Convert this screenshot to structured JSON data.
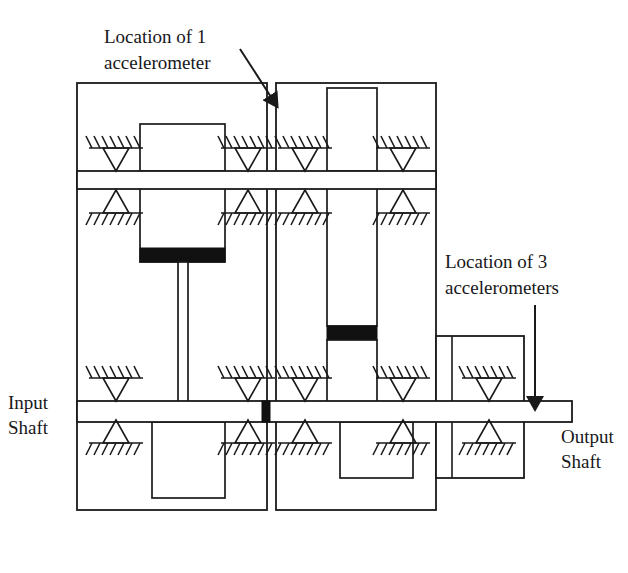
{
  "figure": {
    "kind": "engineering-schematic",
    "background_color": "#ffffff",
    "line_color": "#1a1a1a",
    "fill_color": "#ffffff",
    "gear_mesh_color": "#111111"
  },
  "annotations": {
    "accel_1": {
      "line1": "Location of 1",
      "line2": "accelerometer",
      "arrow": "arrow-down-left"
    },
    "accel_3": {
      "line1": "Location of 3",
      "line2": "accelerometers",
      "arrow": "arrow-down"
    }
  },
  "labels": {
    "input_shaft": {
      "line1": "Input",
      "line2": "Shaft"
    },
    "output_shaft": {
      "line1": "Output",
      "line2": "Shaft"
    }
  },
  "components": {
    "housing_left_chamber": "left gearbox chamber",
    "housing_right_chamber": "right gearbox chamber",
    "housing_output_block": "output bearing housing",
    "shaft_upper": "upper intermediate shaft",
    "shaft_lower": "input / output shaft",
    "bearings_count": 16,
    "gears_count": 6,
    "mesh_bands_count": 3
  },
  "icons": {
    "bearing_down": "bearing-support-down-icon",
    "bearing_up": "bearing-support-up-icon",
    "arrow": "arrow-icon"
  }
}
